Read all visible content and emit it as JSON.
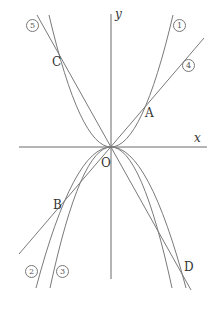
{
  "figure": {
    "axes": {
      "x_label": "x",
      "y_label": "y",
      "origin_label": "O"
    },
    "points": {
      "A": "A",
      "B": "B",
      "C": "C",
      "D": "D"
    },
    "graph_labels": {
      "g1": "1",
      "g2": "2",
      "g3": "3",
      "g4": "4",
      "g5": "5"
    },
    "colors": {
      "line": "#7a7a7a",
      "axis": "#6a6a6a",
      "text": "#333333"
    }
  }
}
